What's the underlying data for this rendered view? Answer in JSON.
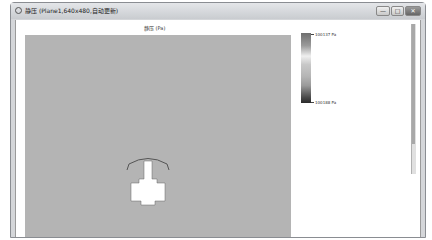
{
  "window": {
    "title": "静压 (Plane1,640x480,自动更新)",
    "controls": {
      "minimize": "—",
      "maximize": "□",
      "close": "✕"
    }
  },
  "plot": {
    "title": "静压 (Pa)",
    "background": "#b4b4b4"
  },
  "colorbar": {
    "max_label": "100137 Pa",
    "min_label": "100188 Pa"
  }
}
